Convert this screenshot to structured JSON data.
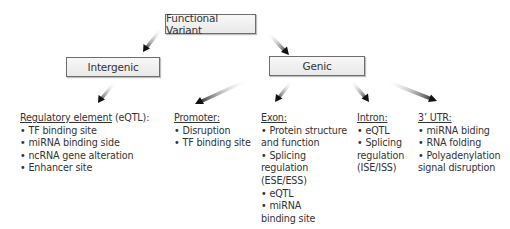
{
  "diagram": {
    "root": {
      "label": "Functional Variant"
    },
    "branches": [
      {
        "label": "Intergenic"
      },
      {
        "label": "Genic"
      }
    ],
    "categories": {
      "regulatory": {
        "heading": "Regulatory element",
        "suffix": " (eQTL):",
        "items": [
          "TF binding site",
          "miRNA binding side",
          "ncRNA gene alteration",
          "Enhancer site"
        ]
      },
      "promoter": {
        "heading": "Promoter:",
        "items": [
          "Disruption",
          "TF binding site"
        ]
      },
      "exon": {
        "heading": "Exon:",
        "items": [
          "Protein structure and function",
          "Splicing regulation (ESE/ESS)",
          "eQTL",
          "miRNA binding site"
        ]
      },
      "intron": {
        "heading": "Intron:",
        "items": [
          "eQTL",
          "Splicing regulation (ISE/ISS)"
        ]
      },
      "utr": {
        "heading": "3’ UTR:",
        "items": [
          "miRNA biding",
          "RNA folding",
          "Polyadenylation signal disruption"
        ]
      }
    },
    "bullet": "• ",
    "colors": {
      "box_border": "#6e6e6e",
      "box_fill": "#efefef",
      "arrow_dark": "#1a1a1a",
      "arrow_light": "#d8d8d8",
      "text": "#333333"
    }
  }
}
